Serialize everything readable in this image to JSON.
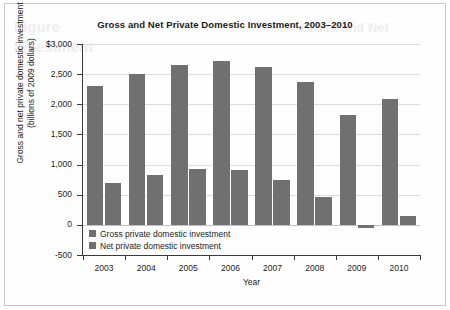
{
  "figure": {
    "background_color": "#ffffff",
    "border_color": "#c9c9c9",
    "bleed_text": {
      "line1": "Figure",
      "line2": "Investment",
      "line3": "Gross and Net"
    }
  },
  "chart_data": {
    "type": "bar",
    "title": "Gross and Net Private Domestic Investment, 2003–2010",
    "xlabel": "Year",
    "ylabel": "Gross and net private domestic investment (billions of 2009 dollars)",
    "ylabel_line1": "Gross and net private domestic investment",
    "ylabel_line2": "(billions of 2009 dollars)",
    "categories": [
      "2003",
      "2004",
      "2005",
      "2006",
      "2007",
      "2008",
      "2009",
      "2010"
    ],
    "series": [
      {
        "name": "Gross private domestic investment",
        "color": "#707070",
        "values": [
          2300,
          2510,
          2655,
          2710,
          2615,
          2365,
          1830,
          2080
        ]
      },
      {
        "name": "Net private domestic investment",
        "color": "#707070",
        "values": [
          700,
          830,
          930,
          910,
          750,
          460,
          -50,
          155
        ]
      }
    ],
    "ylim": [
      -500,
      3000
    ],
    "yticks": [
      3000,
      2500,
      2000,
      1500,
      1000,
      500,
      0,
      -500
    ],
    "ytick_labels": [
      "$3,000",
      "2,500",
      "2,000",
      "1,500",
      "1,000",
      "500",
      "0",
      "-500"
    ],
    "grid": true,
    "legend_position": "inside-bottom-left"
  }
}
